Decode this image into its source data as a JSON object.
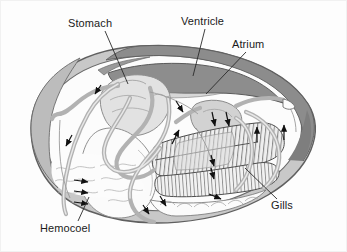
{
  "figure": {
    "background_color": "#fdfdfd",
    "border_color": "#f0f0f0"
  },
  "labels": [
    {
      "id": "stomach",
      "text": "Stomach",
      "x": 68,
      "y": 27,
      "leader_from": [
        105,
        31
      ],
      "leader_to": [
        128,
        84
      ],
      "points_to": "stomach organ mass (upper left interior)"
    },
    {
      "id": "ventricle",
      "text": "Ventricle",
      "x": 181,
      "y": 25,
      "leader_from": [
        205,
        29
      ],
      "leader_to": [
        193,
        73
      ],
      "points_to": "dark gray ventricle band (upper center)"
    },
    {
      "id": "atrium",
      "text": "Atrium",
      "x": 232,
      "y": 48,
      "leader_from": [
        246,
        52
      ],
      "leader_to": [
        206,
        92
      ],
      "points_to": "atrium chamber (right of ventricle)"
    },
    {
      "id": "gills",
      "text": "Gills",
      "x": 271,
      "y": 206,
      "leader_from": [
        277,
        198
      ],
      "leader_to": [
        245,
        169
      ],
      "points_to": "hatched gill lamellae (lower right)"
    },
    {
      "id": "hemocoel",
      "text": "Hemocoel",
      "x": 40,
      "y": 228,
      "leader_from": [
        77,
        221
      ],
      "leader_to": [
        88,
        196
      ],
      "points_to": "open blood sinus region (lower left)"
    }
  ],
  "colors": {
    "shell_outer_line": "#6b6b6b",
    "shell_mantle_fill": "#c9c9c9",
    "shell_dark_band": "#8a8a8a",
    "ventricle_fill": "#8d8d8d",
    "vessel_stroke": "#b3b3b3",
    "organ_fill": "#e3e3e3",
    "gill_line": "#555555",
    "arrow_color": "#111111",
    "label_text": "#1b1b1b",
    "interior_white": "#fcfcfc"
  },
  "flow_arrows": {
    "count": 16,
    "description": "Black solid arrowheads indicating direction of hemolymph flow through vessels, hemocoel sinuses and gills",
    "items": [
      {
        "id": "arrow-stomach-down",
        "x": 95,
        "y": 92,
        "angle": 200
      },
      {
        "id": "arrow-left-descend",
        "x": 66,
        "y": 143,
        "angle": 205
      },
      {
        "id": "arrow-hemocoel-1",
        "x": 84,
        "y": 181,
        "angle": 15
      },
      {
        "id": "arrow-hemocoel-2",
        "x": 84,
        "y": 191,
        "angle": 15
      },
      {
        "id": "arrow-hemocoel-3",
        "x": 84,
        "y": 202,
        "angle": 15
      },
      {
        "id": "arrow-mid-up",
        "x": 178,
        "y": 133,
        "angle": -70
      },
      {
        "id": "arrow-mid-right-down",
        "x": 182,
        "y": 110,
        "angle": 150
      },
      {
        "id": "arrow-atrium-1",
        "x": 215,
        "y": 124,
        "angle": 110
      },
      {
        "id": "arrow-atrium-2",
        "x": 228,
        "y": 124,
        "angle": 110
      },
      {
        "id": "arrow-gill-up-inner",
        "x": 257,
        "y": 130,
        "angle": -90
      },
      {
        "id": "arrow-gill-up-outer",
        "x": 284,
        "y": 128,
        "angle": -90
      },
      {
        "id": "arrow-gill-down-1",
        "x": 214,
        "y": 164,
        "angle": 100
      },
      {
        "id": "arrow-gill-down-2",
        "x": 214,
        "y": 177,
        "angle": 100
      },
      {
        "id": "arrow-mantle-low-left",
        "x": 165,
        "y": 203,
        "angle": 60
      },
      {
        "id": "arrow-mantle-low-right",
        "x": 219,
        "y": 198,
        "angle": 20
      },
      {
        "id": "arrow-shell-lower",
        "x": 148,
        "y": 212,
        "angle": 60
      }
    ]
  },
  "structures": [
    {
      "id": "shell-outline",
      "name": "Bivalve shell valve outline",
      "fill": "#c9c9c9"
    },
    {
      "id": "mantle-edge",
      "name": "Mantle / shell margin band",
      "fill": "#c9c9c9"
    },
    {
      "id": "dorsal-dark-band",
      "name": "Dorsal dark shell hinge band",
      "fill": "#8a8a8a"
    },
    {
      "id": "stomach-mass",
      "name": "Stomach and digestive gland",
      "fill": "#e3e3e3"
    },
    {
      "id": "ventricle-body",
      "name": "Ventricle",
      "fill": "#8d8d8d"
    },
    {
      "id": "atrium-body",
      "name": "Atrium",
      "fill": "#d0d0d0"
    },
    {
      "id": "gill-lamellae",
      "name": "Gill lamellae with vertical hatching",
      "fill": "#ededed"
    },
    {
      "id": "hemocoel-sinus",
      "name": "Hemocoel sinus with wavy texture",
      "fill": "#fcfcfc"
    },
    {
      "id": "vessel-network",
      "name": "Blood vessel loops and aortae",
      "stroke": "#b3b3b3"
    },
    {
      "id": "foot",
      "name": "Muscular foot",
      "fill": "#fcfcfc"
    }
  ]
}
